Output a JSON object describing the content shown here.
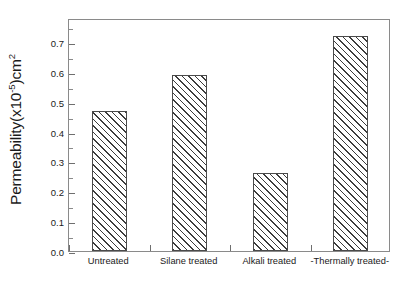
{
  "chart_data": {
    "type": "bar",
    "title": "",
    "xlabel": "",
    "ylabel": "Permeability(x10-5)cm2",
    "ylabel_parts": {
      "prefix": "Permeability(x10",
      "exponent": "-5",
      "suffix": ")cm",
      "suffix_exponent": "2"
    },
    "categories": [
      "Untreated",
      "Silane treated",
      "Alkali treated",
      "-Thermally treated-"
    ],
    "values": [
      0.47,
      0.59,
      0.26,
      0.72
    ],
    "ylim": [
      0.0,
      0.78
    ],
    "ytick_labels": [
      "0.0",
      "0.1",
      "0.2",
      "0.3",
      "0.4",
      "0.5",
      "0.6",
      "0.7"
    ],
    "ytick_values": [
      0.0,
      0.1,
      0.2,
      0.3,
      0.4,
      0.5,
      0.6,
      0.7
    ],
    "yminor_values": [
      0.05,
      0.15,
      0.25,
      0.35,
      0.45,
      0.55,
      0.65,
      0.75
    ],
    "grid": false,
    "legend": null,
    "bar_fill": "hatched-diagonal",
    "bar_edge_color": "#4a4a4a",
    "frame_color": "#8a8a8a",
    "background": "#ffffff"
  }
}
